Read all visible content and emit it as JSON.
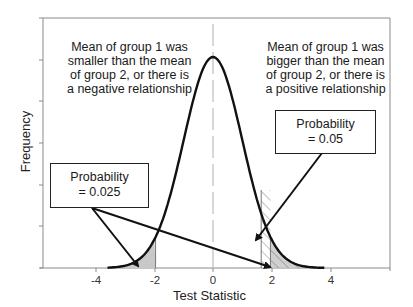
{
  "chart_data": {
    "type": "line",
    "title": "",
    "xlabel": "Test Statistic",
    "ylabel": "Frequency",
    "xlim": [
      -5.8,
      6.0
    ],
    "x_ticks": [
      -4,
      -2,
      0,
      2,
      4
    ],
    "x_tick_labels": [
      "-4",
      "-2",
      "0",
      "2",
      "4"
    ],
    "y_tick_labels": [],
    "y_tick_count": 7,
    "grid": false,
    "series": [
      {
        "name": "Standard normal distribution",
        "distribution": "normal",
        "mean": 0,
        "sd": 1,
        "x_range": [
          -3.6,
          3.8
        ]
      }
    ],
    "shaded_regions": [
      {
        "label": "left tail two-tailed",
        "from": -3.6,
        "to": -1.96,
        "fill": "gray",
        "probability": 0.025
      },
      {
        "label": "right tail two-tailed",
        "from": 1.96,
        "to": 3.8,
        "fill": "gray",
        "probability": 0.025
      },
      {
        "label": "right tail one-tailed",
        "from": 1.645,
        "to": 3.8,
        "fill": "hatched",
        "probability": 0.05
      }
    ],
    "reference_lines": [
      {
        "axis": "x",
        "value": 0,
        "style": "vertical gray line"
      }
    ],
    "annotations": [
      {
        "text": "Mean of group 1 was smaller than the mean of group 2, or there is a negative relationship",
        "position": "upper-left"
      },
      {
        "text": "Mean of group 1 was bigger than the mean of group 2, or there is a positive relationship",
        "position": "upper-right"
      },
      {
        "text": "Probability = 0.025",
        "position": "lower-left callout",
        "arrows_to": [
          "left tail",
          "right tail"
        ]
      },
      {
        "text": "Probability = 0.05",
        "position": "right callout",
        "arrows_to": [
          "right hatched tail"
        ]
      }
    ]
  },
  "labels": {
    "xlabel": "Test Statistic",
    "ylabel": "Frequency",
    "ticks": [
      "-4",
      "-2",
      "0",
      "2",
      "4"
    ],
    "left_note": [
      "Mean of group 1 was",
      "smaller than the mean",
      "of group 2, or there is",
      "a negative relationship"
    ],
    "right_note": [
      "Mean of group 1 was",
      "bigger than the mean",
      "of group 2, or there is",
      "a positive relationship"
    ],
    "left_callout": [
      "Probability",
      "= 0.025"
    ],
    "right_callout": [
      "Probability",
      "= 0.05"
    ]
  },
  "colors": {
    "curve": "#111111",
    "frame": "#8a8a8a",
    "shade": "#c8c8c8",
    "hatch": "#777777",
    "zero_line": "#bdbdbd"
  }
}
